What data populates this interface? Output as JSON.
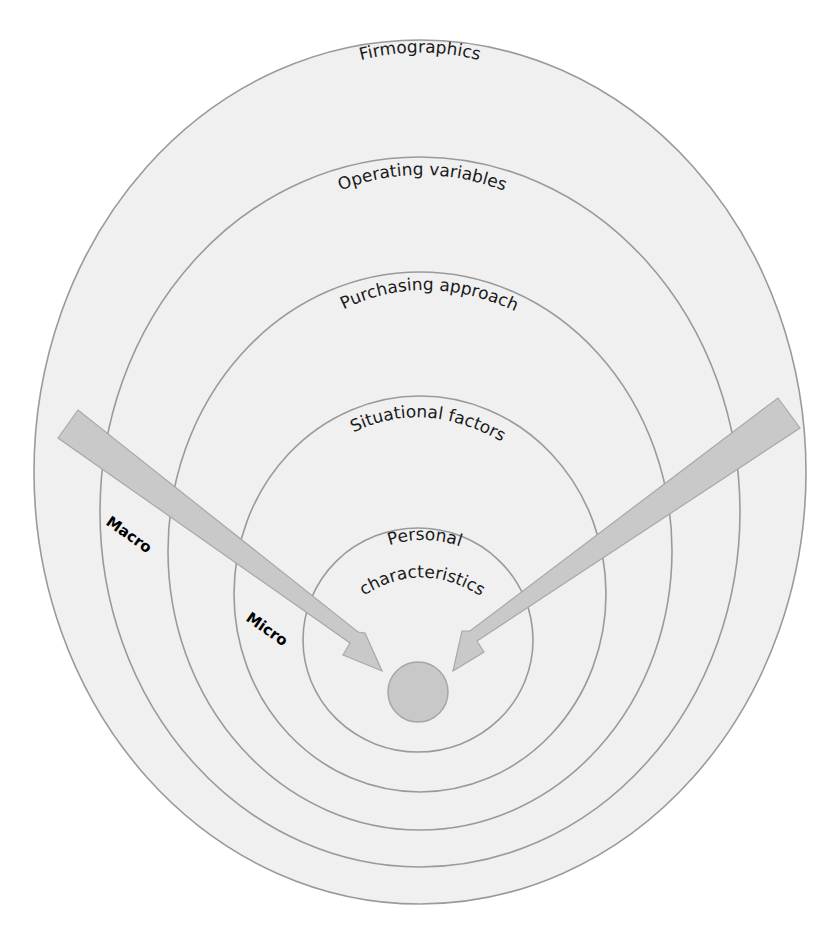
{
  "diagram": {
    "rings": [
      {
        "label": "Firmographics",
        "cx": 420,
        "cy": 472,
        "rx": 386,
        "ry": 432
      },
      {
        "label": "Operating variables",
        "cx": 420,
        "cy": 512,
        "rx": 320,
        "ry": 355
      },
      {
        "label": "Purchasing approach",
        "cx": 420,
        "cy": 551,
        "rx": 252,
        "ry": 279
      },
      {
        "label": "Situational factors",
        "cx": 420,
        "cy": 594,
        "rx": 186,
        "ry": 198
      },
      {
        "label": "Personal characteristics",
        "line1": "Personal",
        "line2": "characteristics",
        "cx": 418,
        "cy": 640,
        "rx": 115,
        "ry": 112
      }
    ],
    "core": {
      "cx": 418,
      "cy": 692,
      "r": 30
    },
    "arrows": [
      {
        "label": "Macro",
        "side": "left"
      },
      {
        "label": "Micro",
        "side": "left"
      }
    ],
    "arrow_labels": {
      "macro": "Macro",
      "micro": "Micro"
    },
    "colors": {
      "ring_fill": "#f0f0f0",
      "ring_stroke": "#9a9a9a",
      "arrow_fill": "#c9c9c9",
      "core_fill": "#c8c8c8",
      "text": "#1a1a1a"
    }
  }
}
